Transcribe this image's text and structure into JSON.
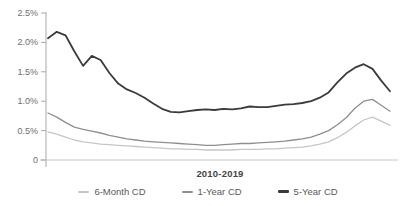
{
  "chart_data": {
    "type": "line",
    "title": "",
    "xlabel": "2010-2019",
    "ylabel": "",
    "x_range": [
      "2010",
      "2019"
    ],
    "x_points_per_series": 40,
    "ylim": [
      0,
      2.5
    ],
    "grid": false,
    "legend_position": "bottom",
    "axis_color": "#a9a9a9",
    "baseline_color": "#c6c6c6",
    "tick_label_color": "#6e6e6e",
    "y_ticks": [
      {
        "label": "2.5%",
        "value": 2.5
      },
      {
        "label": "2.0%",
        "value": 2.0
      },
      {
        "label": "1.5%",
        "value": 1.5
      },
      {
        "label": "1.0%",
        "value": 1.0
      },
      {
        "label": "0.5%",
        "value": 0.5
      },
      {
        "label": "0",
        "value": 0
      }
    ],
    "series": [
      {
        "name": "6-Month CD",
        "color": "#c6c6c6",
        "stroke_width": 1.3,
        "legend_dash_px": 2,
        "values": [
          0.48,
          0.44,
          0.39,
          0.34,
          0.31,
          0.29,
          0.27,
          0.26,
          0.25,
          0.24,
          0.23,
          0.22,
          0.21,
          0.2,
          0.19,
          0.19,
          0.18,
          0.18,
          0.17,
          0.17,
          0.17,
          0.17,
          0.18,
          0.18,
          0.18,
          0.19,
          0.19,
          0.2,
          0.21,
          0.22,
          0.24,
          0.27,
          0.31,
          0.38,
          0.47,
          0.58,
          0.68,
          0.73,
          0.66,
          0.59
        ]
      },
      {
        "name": "1-Year CD",
        "color": "#8f8f8f",
        "stroke_width": 1.3,
        "legend_dash_px": 2,
        "values": [
          0.8,
          0.73,
          0.64,
          0.56,
          0.52,
          0.49,
          0.46,
          0.42,
          0.39,
          0.36,
          0.34,
          0.32,
          0.31,
          0.3,
          0.29,
          0.28,
          0.27,
          0.26,
          0.25,
          0.25,
          0.26,
          0.27,
          0.28,
          0.28,
          0.29,
          0.3,
          0.31,
          0.32,
          0.34,
          0.36,
          0.39,
          0.44,
          0.5,
          0.6,
          0.72,
          0.88,
          1.0,
          1.03,
          0.93,
          0.83
        ]
      },
      {
        "name": "5-Year CD",
        "color": "#3b3b3b",
        "stroke_width": 1.8,
        "legend_dash_px": 3,
        "values": [
          2.07,
          2.18,
          2.12,
          1.85,
          1.6,
          1.77,
          1.7,
          1.48,
          1.3,
          1.2,
          1.14,
          1.06,
          0.96,
          0.87,
          0.82,
          0.81,
          0.83,
          0.85,
          0.86,
          0.85,
          0.87,
          0.86,
          0.88,
          0.91,
          0.9,
          0.9,
          0.92,
          0.94,
          0.95,
          0.97,
          1.0,
          1.06,
          1.15,
          1.32,
          1.47,
          1.57,
          1.63,
          1.55,
          1.35,
          1.17
        ]
      }
    ]
  }
}
